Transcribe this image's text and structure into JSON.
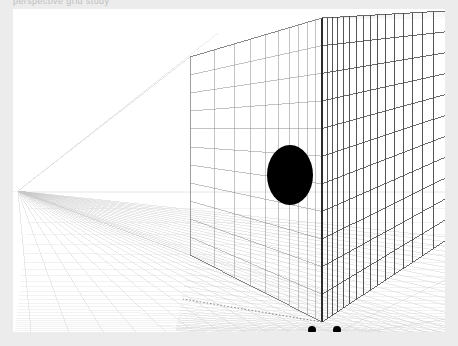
{
  "app": {
    "title": "Perspective Wireframe Viewer",
    "header_text": "perspective grid study",
    "canvas_label": "drawing-canvas"
  },
  "canvas": {
    "background_color": "#ffffff",
    "page_background_color": "#ececec",
    "width": 432,
    "height": 323,
    "origin_x": 13,
    "origin_y": 9
  },
  "chart_data": {
    "type": "scatter",
    "xlabel": "",
    "ylabel": "",
    "projection": "2-point perspective",
    "vanishing_points": [
      {
        "name": "left-vanishing-point",
        "x": 5,
        "y": 182
      },
      {
        "name": "right-vanishing-point",
        "x": 1180,
        "y": 182
      }
    ],
    "horizon_y": 182,
    "geometry": {
      "back_wall": {
        "name": "back-wall-grid",
        "left_x": 177,
        "right_x": 309,
        "top_left_y": 48,
        "top_right_y": 9,
        "bottom_left_y": 246,
        "bottom_right_y": 313,
        "columns": 10,
        "rows": 11,
        "stroke": "#8a8a8a",
        "stroke_width": 0.6
      },
      "right_wall": {
        "name": "right-wall-grid",
        "near_x": 309,
        "far_x": 432,
        "columns": 16,
        "rows": 11,
        "stroke": "#3a3a3a",
        "stroke_width": 0.9
      },
      "floor": {
        "name": "floor-grid",
        "lines_to_vp": 34,
        "cross_lines": 26,
        "stroke": "#b9b9b9",
        "stroke_width": 0.45
      },
      "left_cone": {
        "name": "left-perspective-cone",
        "apex_x": 5,
        "apex_y": 182,
        "stroke": "#cccccc"
      }
    },
    "ellipse": {
      "name": "black-ellipse-marker",
      "cx": 277,
      "cy": 166,
      "rx": 23,
      "ry": 30,
      "fill": "#000000"
    },
    "points": [
      {
        "name": "marker-dot-1",
        "x": 299,
        "y": 321,
        "r": 4,
        "fill": "#000000"
      },
      {
        "name": "marker-dot-2",
        "x": 324,
        "y": 321,
        "r": 4,
        "fill": "#000000"
      }
    ],
    "grid": true,
    "legend": "none"
  },
  "colors": {
    "ink_dark": "#2b2b2b",
    "ink_mid": "#8a8a8a",
    "ink_light": "#c8c8c8",
    "ink_faint": "#e0e0e0",
    "marker": "#000000",
    "canvas": "#ffffff",
    "page": "#ececec"
  }
}
